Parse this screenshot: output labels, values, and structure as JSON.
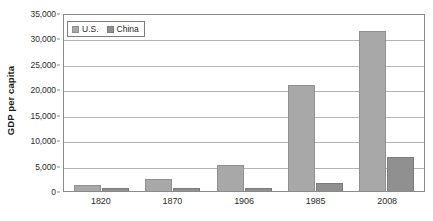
{
  "chart_data": {
    "type": "bar",
    "title": "",
    "subtitle": "",
    "xlabel": "",
    "ylabel": "GDP per capita",
    "categories": [
      "1820",
      "1870",
      "1906",
      "1985",
      "2008"
    ],
    "series": [
      {
        "name": "U.S.",
        "color": "#a8a8a8",
        "values": [
          1200,
          2450,
          5100,
          20800,
          31500
        ]
      },
      {
        "name": "China",
        "color": "#909090",
        "values": [
          600,
          530,
          550,
          1500,
          6700
        ]
      }
    ],
    "ylim": [
      0,
      35000
    ],
    "ytick_values": [
      0,
      5000,
      10000,
      15000,
      20000,
      25000,
      30000,
      35000
    ],
    "ytick_labels": [
      "0",
      "5,000",
      "10,000",
      "15,000",
      "20,000",
      "25,000",
      "30,000",
      "35,000"
    ],
    "grid": true,
    "grid_axis": "y",
    "legend": {
      "position": "top-left-inside",
      "entries": [
        "U.S.",
        "China"
      ]
    },
    "plot_background": "#ffffff",
    "gridline_color": "#b3b3b3",
    "axis_color": "#8a8a8a"
  }
}
